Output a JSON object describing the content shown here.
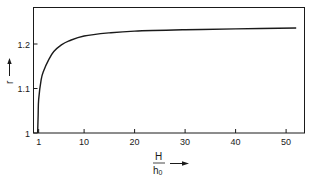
{
  "chart_data": {
    "type": "line",
    "title": "",
    "xlabel": "H/h0",
    "xlabel_numerator": "H",
    "xlabel_denominator": "h0",
    "ylabel": "r",
    "xlim": [
      0,
      54
    ],
    "ylim": [
      1,
      1.3
    ],
    "grid": false,
    "legend": null,
    "x_ticks": [
      1,
      10,
      20,
      30,
      40,
      50
    ],
    "x_tick_labels": [
      "1",
      "10",
      "20",
      "30",
      "40",
      "50"
    ],
    "y_ticks": [
      1,
      1.1,
      1.2
    ],
    "y_tick_labels": [
      "1",
      "1.1",
      "1.2"
    ],
    "series": [
      {
        "name": "r",
        "x": [
          0.8,
          0.9,
          1.0,
          1.5,
          2,
          3,
          4,
          5.5,
          7,
          10,
          15,
          20,
          30,
          40,
          52
        ],
        "values": [
          1.0,
          1.04,
          1.075,
          1.12,
          1.14,
          1.165,
          1.183,
          1.198,
          1.207,
          1.218,
          1.225,
          1.229,
          1.232,
          1.234,
          1.236
        ]
      }
    ]
  }
}
